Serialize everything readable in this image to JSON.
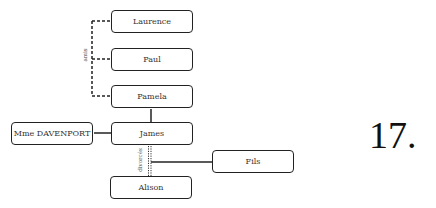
{
  "diagram": {
    "type": "family-tree",
    "nodes": [
      {
        "id": "laurence",
        "label": "Laurence"
      },
      {
        "id": "paul",
        "label": "Paul"
      },
      {
        "id": "pamela",
        "label": "Pamela"
      },
      {
        "id": "mme_davenport",
        "label": "Mme DAVENPORT"
      },
      {
        "id": "james",
        "label": "James"
      },
      {
        "id": "fils",
        "label": "Fils"
      },
      {
        "id": "alison",
        "label": "Alison"
      }
    ],
    "relations": {
      "friends_label": "amis",
      "divorced_label": "divorcés"
    },
    "edges": [
      {
        "from": "laurence",
        "to": "pamela",
        "style": "dashed",
        "label": "amis"
      },
      {
        "from": "paul",
        "to": "pamela",
        "style": "dashed",
        "label": "amis"
      },
      {
        "from": "pamela",
        "to": "james",
        "style": "solid"
      },
      {
        "from": "mme_davenport",
        "to": "james",
        "style": "solid"
      },
      {
        "from": "james",
        "to": "alison",
        "style": "dotted-double",
        "label": "divorcés"
      },
      {
        "from": "james-alison",
        "to": "fils",
        "style": "solid"
      }
    ]
  },
  "page_number": "17."
}
